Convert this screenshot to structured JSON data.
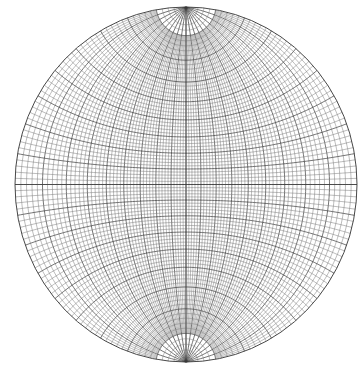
{
  "diagram": {
    "type": "wulff-stereonet",
    "projection": "equal-angle stereographic (meridional net)",
    "center": [
      186,
      184.5
    ],
    "radius_x": 171,
    "radius_y": 177.5,
    "minor_interval_deg": 2,
    "major_interval_deg": 10,
    "great_circle_cutoff_deg": 80,
    "colors": {
      "background": "#ffffff",
      "minor_line": "#6a6a6a",
      "major_line": "#3a3a3a",
      "outline": "#333333"
    },
    "line_widths": {
      "minor": 0.45,
      "major": 0.7,
      "outline": 0.9
    }
  }
}
